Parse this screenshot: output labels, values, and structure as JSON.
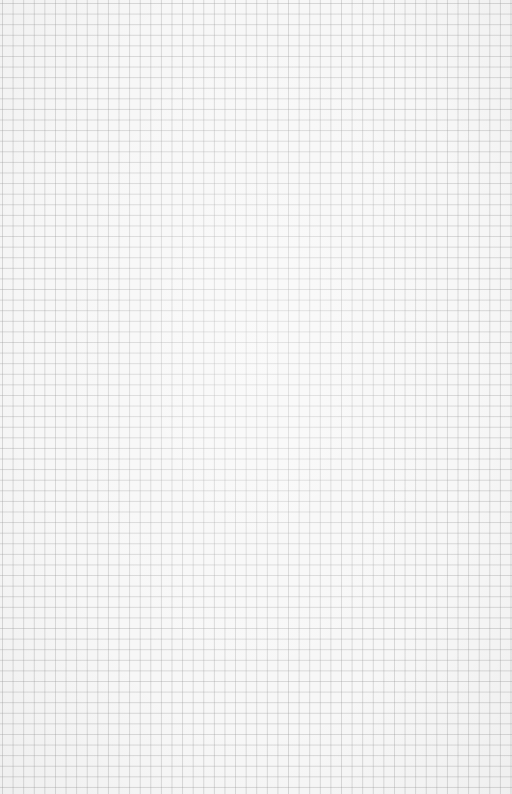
{
  "image": {
    "subject": "blank graph paper sheet",
    "grid": {
      "spacing_px": 10.6,
      "line_color": "#b4b4b4",
      "paper_color": "#f7f7f7"
    }
  }
}
